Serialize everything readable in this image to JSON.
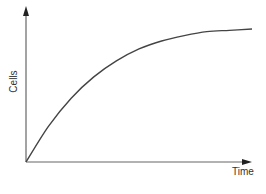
{
  "chart_data": {
    "type": "line",
    "title": "",
    "xlabel": "Time",
    "ylabel": "Cells",
    "grid": false,
    "legend": null,
    "ticks": {
      "x": [],
      "y": []
    },
    "series": [
      {
        "name": "Cells",
        "shape": "saturating growth (concave, plateau)",
        "x": [
          0,
          0.1,
          0.2,
          0.3,
          0.4,
          0.5,
          0.6,
          0.7,
          0.8,
          0.9,
          1.0
        ],
        "y": [
          0,
          0.27,
          0.48,
          0.64,
          0.76,
          0.85,
          0.91,
          0.95,
          0.98,
          0.99,
          1.0
        ]
      }
    ],
    "xlim": [
      0,
      1
    ],
    "ylim": [
      0,
      1.15
    ]
  },
  "colors": {
    "axis": "#555555",
    "curve": "#444444",
    "text": "#333333"
  }
}
